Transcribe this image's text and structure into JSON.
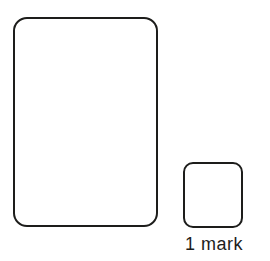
{
  "page": {
    "background": "#ffffff"
  },
  "diagram": {
    "stroke_color": "#1d1d1b",
    "fill_color": "#ffffff",
    "shapes": [
      {
        "id": "large-rectangle",
        "label": ""
      },
      {
        "id": "unit-square",
        "label": "1 mark"
      }
    ],
    "unit_label": "1 mark"
  }
}
